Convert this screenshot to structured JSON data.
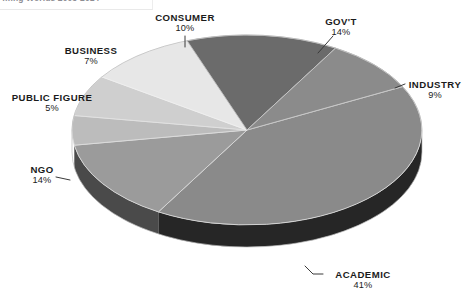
{
  "header": {
    "clipped_text": "…ing Worlds 2005-2014"
  },
  "chart_data": {
    "type": "pie",
    "title": "",
    "subtitle": "",
    "xlabel": "",
    "ylabel": "",
    "legend_position": "none",
    "grid": false,
    "three_d": true,
    "value_unit": "percent",
    "categories": [
      "GOV'T",
      "INDUSTRY",
      "ACADEMIC",
      "NGO",
      "PUBLIC FIGURE",
      "BUSINESS",
      "CONSUMER"
    ],
    "values": [
      14,
      9,
      41,
      14,
      5,
      7,
      10
    ],
    "labels": [
      {
        "name": "GOV'T",
        "pct": "14%",
        "value": 14,
        "color": "#6b6b6b"
      },
      {
        "name": "INDUSTRY",
        "pct": "9%",
        "value": 9,
        "color": "#8b8b8b"
      },
      {
        "name": "ACADEMIC",
        "pct": "41%",
        "value": 41,
        "color": "#8a8a8a"
      },
      {
        "name": "NGO",
        "pct": "14%",
        "value": 14,
        "color": "#9b9b9b"
      },
      {
        "name": "PUBLIC FIGURE",
        "pct": "5%",
        "value": 5,
        "color": "#bcbcbc"
      },
      {
        "name": "BUSINESS",
        "pct": "7%",
        "value": 7,
        "color": "#cfcfcf"
      },
      {
        "name": "CONSUMER",
        "pct": "10%",
        "value": 10,
        "color": "#e7e7e7"
      }
    ],
    "total": 100
  },
  "slices": {
    "govt": {
      "name": "GOV'T",
      "pct": "14%"
    },
    "industry": {
      "name": "INDUSTRY",
      "pct": "9%"
    },
    "academic": {
      "name": "ACADEMIC",
      "pct": "41%"
    },
    "ngo": {
      "name": "NGO",
      "pct": "14%"
    },
    "public_figure": {
      "name": "PUBLIC FIGURE",
      "pct": "5%"
    },
    "business": {
      "name": "BUSINESS",
      "pct": "7%"
    },
    "consumer": {
      "name": "CONSUMER",
      "pct": "10%"
    }
  },
  "colors": {
    "govt": "#6b6b6b",
    "industry": "#8b8b8b",
    "academic": "#8a8a8a",
    "ngo": "#9b9b9b",
    "public_figure": "#bcbcbc",
    "business": "#cfcfcf",
    "consumer": "#e7e7e7",
    "academic_side": "#262626",
    "ngo_side": "#4a4a4a",
    "leader_line": "#3a3a3a",
    "background": "#ffffff",
    "text": "#1b1b1b"
  }
}
